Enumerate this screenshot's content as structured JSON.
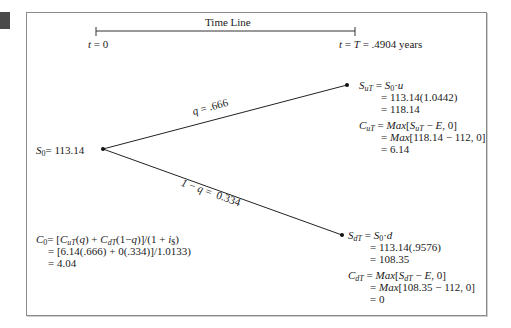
{
  "timeline": {
    "title": "Time Line",
    "start_label": "t = 0",
    "end_label": "t = T = .4904 years"
  },
  "root": {
    "label": "S0 = 113.14",
    "value": "113.14"
  },
  "branches": {
    "up_label": "q = .666",
    "down_label": "1 − q = 0.334"
  },
  "up_node": {
    "stock_lines": [
      "SuT = S0·u",
      "= 113.14(1.0442)",
      "= 118.14"
    ],
    "call_lines": [
      "CuT = Max[SuT − E, 0]",
      "= Max[118.14 − 112, 0]",
      "= 6.14"
    ],
    "u": "1.0442",
    "price": "118.14",
    "call_value": "6.14"
  },
  "down_node": {
    "stock_lines": [
      "SdT = S0·d",
      "= 113.14(.9576)",
      "= 108.35"
    ],
    "call_lines": [
      "CdT = Max[SdT − E, 0]",
      "= Max[108.35 − 112, 0]",
      "= 0"
    ],
    "d": ".9576",
    "price": "108.35",
    "call_value": "0"
  },
  "valuation": {
    "lines": [
      "C0 = [CuT(q) + CdT(1−q)]/(1 + i$)",
      "= [6.14(.666) + 0(.334)]/1.0133",
      "= 4.04"
    ],
    "result": "4.04"
  },
  "parameters": {
    "strike_E": "112",
    "discount_factor": "1.0133",
    "q": ".666",
    "one_minus_q": "0.334",
    "T_years": ".4904"
  }
}
